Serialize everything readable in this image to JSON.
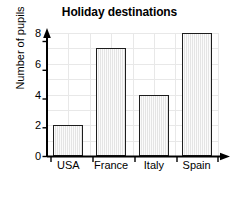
{
  "chart_data": {
    "type": "bar",
    "title": "Holiday destinations",
    "xlabel": "Country",
    "ylabel": "Number of pupils",
    "categories": [
      "USA",
      "France",
      "Italy",
      "Spain"
    ],
    "values": [
      2,
      7,
      4,
      8
    ],
    "ylim": [
      0,
      8
    ],
    "yticks": [
      0,
      2,
      4,
      6,
      8
    ],
    "ytick_labels": [
      "0",
      "2",
      "4",
      "6",
      "8"
    ],
    "grid": true,
    "legend": false,
    "bar_fill": "#e4e4e4",
    "bar_edge": "#1d1d1d",
    "grid_color": "#e8e8e8",
    "axis_color": "#000000",
    "background": "#ffffff"
  }
}
